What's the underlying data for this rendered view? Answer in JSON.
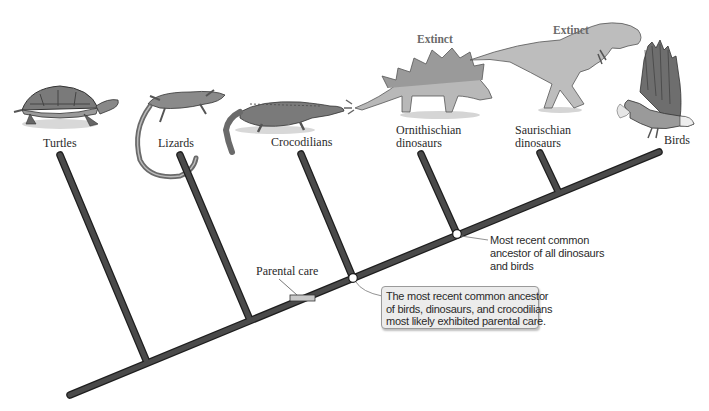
{
  "diagram": {
    "type": "cladogram",
    "colors": {
      "branch_fill": "#4a4a4a",
      "branch_outline": "#1e1e1e",
      "node_fill": "#ffffff",
      "callout_fill": "#ececec",
      "trait_bar_fill": "#c8c8c8"
    },
    "taxa": [
      {
        "id": "turtles",
        "label_lines": [
          "Turtles"
        ],
        "icon": "turtle-illustration",
        "extinct": false
      },
      {
        "id": "lizards",
        "label_lines": [
          "Lizards"
        ],
        "icon": "lizard-illustration",
        "extinct": false
      },
      {
        "id": "crocodilians",
        "label_lines": [
          "Crocodilians"
        ],
        "icon": "crocodile-illustration",
        "extinct": false
      },
      {
        "id": "ornithischian",
        "label_lines": [
          "Ornithischian",
          "dinosaurs"
        ],
        "icon": "stegosaurus-illustration",
        "extinct": true,
        "extinct_label": "Extinct"
      },
      {
        "id": "saurischian",
        "label_lines": [
          "Saurischian",
          "dinosaurs"
        ],
        "icon": "tyrannosaurus-illustration",
        "extinct": true,
        "extinct_label": "Extinct"
      },
      {
        "id": "birds",
        "label_lines": [
          "Birds"
        ],
        "icon": "eagle-illustration",
        "extinct": false
      }
    ],
    "trait": {
      "label": "Parental care"
    },
    "nodes": [
      {
        "id": "archosaur-ancestor",
        "callout_lines": [
          "The most recent common ancestor",
          "of birds, dinosaurs, and crocodilians",
          "most likely exhibited parental care."
        ]
      },
      {
        "id": "dinosaur-ancestor",
        "annotation_lines": [
          "Most recent common",
          "ancestor of all dinosaurs",
          "and birds"
        ]
      }
    ]
  }
}
